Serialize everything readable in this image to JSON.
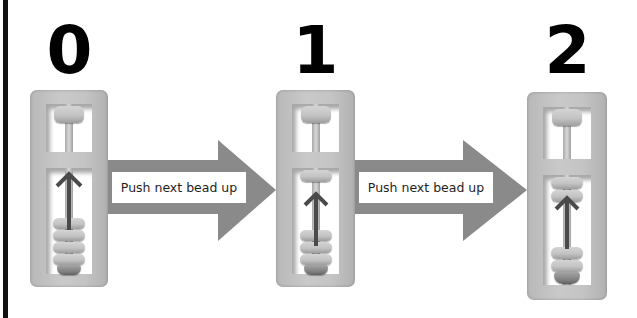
{
  "diagram": {
    "colors": {
      "edge_bar": "#111111",
      "digit": "#000000",
      "frame": "#c4c4c4",
      "arrow": "#8a8a8a",
      "label_bg": "#ffffff",
      "label_text": "#1e1e1e",
      "up_arrow": "#4a4a4a"
    },
    "steps": [
      {
        "digit": "0",
        "beads_up": 0,
        "beads_down": 4
      },
      {
        "digit": "1",
        "beads_up": 1,
        "beads_down": 3
      },
      {
        "digit": "2",
        "beads_up": 2,
        "beads_down": 2
      }
    ],
    "transitions": [
      {
        "label": "Push next bead up",
        "from": "0",
        "to": "1"
      },
      {
        "label": "Push next bead up",
        "from": "1",
        "to": "2"
      }
    ]
  }
}
